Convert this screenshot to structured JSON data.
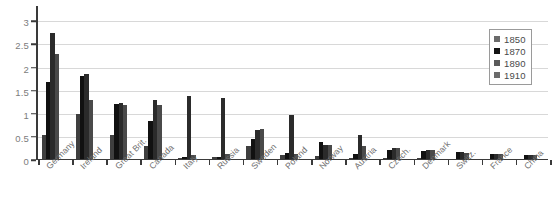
{
  "chart_data": {
    "type": "bar",
    "title": "",
    "subtitle": "",
    "xlabel": "",
    "ylabel": "",
    "ylim": [
      0,
      3.2
    ],
    "yticks": [
      "0",
      "0.5",
      "1",
      "1.5",
      "2",
      "2.5",
      "3"
    ],
    "ytick_values": [
      0,
      0.5,
      1,
      1.5,
      2,
      2.5,
      3
    ],
    "grid": true,
    "legend_position": "top-right",
    "categories": [
      "Germany",
      "Ireland",
      "Great Brit.",
      "Canada",
      "Italy",
      "Russia",
      "Sweden",
      "Poland",
      "Norway",
      "Austria",
      "Czech.",
      "Denmark",
      "Switz.",
      "France",
      "China"
    ],
    "series": [
      {
        "name": "1850",
        "color": "#3f3f3f",
        "values": [
          0.55,
          1.0,
          0.55,
          0.3,
          0.05,
          0.06,
          0.3,
          0.1,
          0.08,
          0.05,
          0.05,
          0.04,
          0.03,
          0.03,
          0.03
        ]
      },
      {
        "name": "1870",
        "color": "#111111",
        "values": [
          1.68,
          1.82,
          1.22,
          0.85,
          0.06,
          0.07,
          0.46,
          0.15,
          0.38,
          0.12,
          0.22,
          0.2,
          0.17,
          0.14,
          0.1
        ]
      },
      {
        "name": "1890",
        "color": "#2b2b2b",
        "values": [
          2.75,
          1.85,
          1.24,
          1.3,
          1.38,
          1.35,
          0.65,
          0.98,
          0.32,
          0.55,
          0.25,
          0.22,
          0.17,
          0.13,
          0.11
        ]
      },
      {
        "name": "1910",
        "color": "#4a4a4a",
        "values": [
          2.3,
          1.3,
          1.2,
          1.18,
          0.1,
          0.12,
          0.67,
          0.12,
          0.33,
          0.3,
          0.27,
          0.21,
          0.16,
          0.12,
          0.1
        ]
      }
    ]
  },
  "legend": {
    "entries": [
      {
        "label": "1850",
        "color": "#6b6b6b"
      },
      {
        "label": "1870",
        "color": "#141414"
      },
      {
        "label": "1890",
        "color": "#5a5a5a"
      },
      {
        "label": "1910",
        "color": "#6b6b6b"
      }
    ]
  },
  "colors": {
    "background": "#ffffff",
    "grid": "#d8d8d8",
    "axis": "#3a3a3a",
    "tick_text": "#7c7c7c",
    "label_text": "#6e6e6e",
    "legend_border": "#9a9a9a"
  }
}
